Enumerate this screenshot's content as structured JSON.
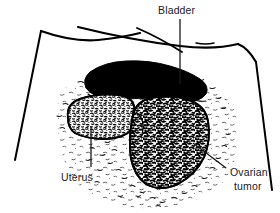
{
  "figure": {
    "background_color": "#ffffff",
    "ink_color": "#000000",
    "width": 280,
    "height": 213
  },
  "annotations": {
    "bladder": {
      "label": "Bladder",
      "label_x": 165,
      "label_y": 14,
      "leader": {
        "x1": 180,
        "y1": 19,
        "x2": 180,
        "y2": 84
      }
    },
    "uterus": {
      "label": "Uterus",
      "label_x": 61,
      "label_y": 180,
      "leader": {
        "x1": 91,
        "y1": 167,
        "x2": 91,
        "y2": 126
      }
    },
    "ovarian_tumor": {
      "label_line1": "Ovarian",
      "label_line2": "tumor",
      "label_x": 230,
      "label_y": 175,
      "label_y2": 189,
      "leader": {
        "x1": 226,
        "y1": 168,
        "x2": 193,
        "y2": 143
      }
    }
  },
  "structures": {
    "retractor_frame": {
      "name": "retractor-frame",
      "description": "Open trapezoidal retractor outline framing the surgical field"
    },
    "bladder_mass": {
      "name": "bladder-mass",
      "fill": "#000000",
      "description": "Solid black elongated bladder silhouette"
    },
    "uterus_mass": {
      "name": "uterus-mass",
      "fill": "#ffffff",
      "description": "Rounded uterus body with light stippled texture"
    },
    "ovarian_tumor_mass": {
      "name": "ovarian-tumor-mass",
      "fill": "#ffffff",
      "description": "Large lobulated ovarian tumor with dense dark mottled texture"
    },
    "background_texture": {
      "name": "peritoneal-stipple",
      "description": "Sparse dash stipple representing surrounding tissue"
    }
  }
}
